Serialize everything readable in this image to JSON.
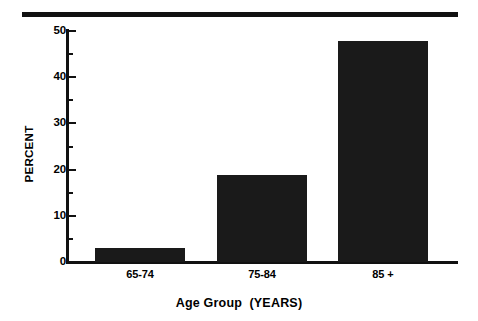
{
  "chart_data": {
    "type": "bar",
    "title": "",
    "subtitle": "",
    "xlabel": "Age Group  (YEARS)",
    "ylabel": "PERCENT",
    "categories": [
      "65-74",
      "75-84",
      "85 +"
    ],
    "values": [
      3.0,
      18.8,
      47.8
    ],
    "series": [
      {
        "name": "Percent",
        "values": [
          3.0,
          18.8,
          47.8
        ]
      }
    ],
    "ylim": [
      0,
      50
    ],
    "ytick_labels": [
      "0",
      "10",
      "20",
      "30",
      "40",
      "50"
    ],
    "ytick_values": [
      0,
      10,
      20,
      30,
      40,
      50
    ],
    "yminor_tick_values": [
      5,
      15,
      25,
      35,
      45
    ],
    "grid": false,
    "legend": false,
    "legend_position": "none",
    "bar_color": "#1a1a1a",
    "axis_color": "#111111",
    "background_color": "#ffffff",
    "annotations": []
  },
  "decor": {
    "top_rule_color": "#111111"
  }
}
